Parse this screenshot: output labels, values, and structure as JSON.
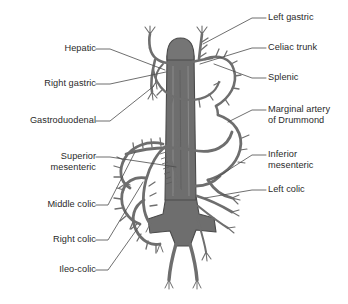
{
  "figure": {
    "type": "anatomical-diagram",
    "background_color": "#ffffff",
    "vessel_fill": "#6e6e6e",
    "vessel_stroke": "#3f3f3f",
    "leader_line_color": "#4a4a4a",
    "text_color": "#2a2a2a"
  },
  "labels": {
    "left": [
      {
        "id": "hepatic",
        "text": "Hepatic",
        "side": "left"
      },
      {
        "id": "right-gastric",
        "text": "Right gastric",
        "side": "left"
      },
      {
        "id": "gastroduodenal",
        "text": "Gastroduodenal",
        "side": "left"
      },
      {
        "id": "superior-mesenteric-l1",
        "text": "Superior",
        "side": "left"
      },
      {
        "id": "superior-mesenteric-l2",
        "text": "mesenteric",
        "side": "left"
      },
      {
        "id": "middle-colic",
        "text": "Middle colic",
        "side": "left"
      },
      {
        "id": "right-colic",
        "text": "Right colic",
        "side": "left"
      },
      {
        "id": "ileo-colic",
        "text": "Ileo-colic",
        "side": "left"
      }
    ],
    "right": [
      {
        "id": "left-gastric",
        "text": "Left gastric",
        "side": "right"
      },
      {
        "id": "celiac-trunk",
        "text": "Celiac trunk",
        "side": "right"
      },
      {
        "id": "splenic",
        "text": "Splenic",
        "side": "right"
      },
      {
        "id": "marginal-artery-l1",
        "text": "Marginal artery",
        "side": "right"
      },
      {
        "id": "marginal-artery-l2",
        "text": "of Drummond",
        "side": "right"
      },
      {
        "id": "inferior-mesenteric-l1",
        "text": "Inferior",
        "side": "right"
      },
      {
        "id": "inferior-mesenteric-l2",
        "text": "mesenteric",
        "side": "right"
      },
      {
        "id": "left-colic",
        "text": "Left colic",
        "side": "right"
      }
    ]
  }
}
